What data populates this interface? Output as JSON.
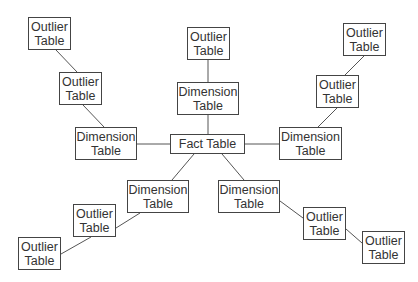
{
  "diagram": {
    "title": "",
    "nodes": [
      {
        "id": "ot1",
        "label": "Outlier\nTable",
        "x": 28,
        "y": 17,
        "w": 43,
        "h": 33
      },
      {
        "id": "ot2",
        "label": "Outlier\nTable",
        "x": 59,
        "y": 72,
        "w": 43,
        "h": 33
      },
      {
        "id": "dt_left",
        "label": "Dimension\nTable",
        "x": 75,
        "y": 127,
        "w": 62,
        "h": 33
      },
      {
        "id": "fact",
        "label": "Fact Table",
        "x": 170,
        "y": 134,
        "w": 75,
        "h": 20
      },
      {
        "id": "ot_top",
        "label": "Outlier\nTable",
        "x": 187,
        "y": 27,
        "w": 43,
        "h": 33
      },
      {
        "id": "dt_top",
        "label": "Dimension\nTable",
        "x": 177,
        "y": 82,
        "w": 62,
        "h": 33
      },
      {
        "id": "ot_tr1",
        "label": "Outlier\nTable",
        "x": 343,
        "y": 23,
        "w": 43,
        "h": 33
      },
      {
        "id": "ot_tr2",
        "label": "Outlier\nTable",
        "x": 316,
        "y": 75,
        "w": 43,
        "h": 33
      },
      {
        "id": "dt_right",
        "label": "Dimension\nTable",
        "x": 279,
        "y": 127,
        "w": 63,
        "h": 33
      },
      {
        "id": "dt_bl",
        "label": "Dimension\nTable",
        "x": 127,
        "y": 180,
        "w": 62,
        "h": 33
      },
      {
        "id": "ot_bl1",
        "label": "Outlier\nTable",
        "x": 73,
        "y": 204,
        "w": 43,
        "h": 33
      },
      {
        "id": "ot_bl2",
        "label": "Outlier\nTable",
        "x": 18,
        "y": 237,
        "w": 43,
        "h": 33
      },
      {
        "id": "dt_br",
        "label": "Dimension\nTable",
        "x": 218,
        "y": 180,
        "w": 62,
        "h": 33
      },
      {
        "id": "ot_br1",
        "label": "Outlier\nTable",
        "x": 303,
        "y": 207,
        "w": 43,
        "h": 33
      },
      {
        "id": "ot_br2",
        "label": "Outlier\nTable",
        "x": 362,
        "y": 231,
        "w": 43,
        "h": 33
      }
    ],
    "edges": [
      {
        "from": "ot1",
        "to": "ot2",
        "x1": 56,
        "y1": 50,
        "x2": 77,
        "y2": 72
      },
      {
        "from": "ot2",
        "to": "dt_left",
        "x1": 83,
        "y1": 105,
        "x2": 104,
        "y2": 127
      },
      {
        "from": "dt_left",
        "to": "fact",
        "x1": 137,
        "y1": 144,
        "x2": 170,
        "y2": 144
      },
      {
        "from": "ot_top",
        "to": "dt_top",
        "x1": 208,
        "y1": 60,
        "x2": 208,
        "y2": 82
      },
      {
        "from": "dt_top",
        "to": "fact",
        "x1": 208,
        "y1": 115,
        "x2": 208,
        "y2": 134
      },
      {
        "from": "ot_tr1",
        "to": "ot_tr2",
        "x1": 364,
        "y1": 56,
        "x2": 345,
        "y2": 75
      },
      {
        "from": "ot_tr2",
        "to": "dt_right",
        "x1": 337,
        "y1": 108,
        "x2": 318,
        "y2": 127
      },
      {
        "from": "fact",
        "to": "dt_right",
        "x1": 245,
        "y1": 144,
        "x2": 279,
        "y2": 144
      },
      {
        "from": "fact",
        "to": "dt_bl",
        "x1": 194,
        "y1": 154,
        "x2": 172,
        "y2": 180
      },
      {
        "from": "dt_bl",
        "to": "ot_bl1",
        "x1": 140,
        "y1": 213,
        "x2": 116,
        "y2": 228
      },
      {
        "from": "ot_bl1",
        "to": "ot_bl2",
        "x1": 91,
        "y1": 237,
        "x2": 61,
        "y2": 254
      },
      {
        "from": "fact",
        "to": "dt_br",
        "x1": 222,
        "y1": 154,
        "x2": 244,
        "y2": 180
      },
      {
        "from": "dt_br",
        "to": "ot_br1",
        "x1": 280,
        "y1": 201,
        "x2": 303,
        "y2": 218
      },
      {
        "from": "ot_br1",
        "to": "ot_br2",
        "x1": 346,
        "y1": 229,
        "x2": 362,
        "y2": 243
      }
    ]
  }
}
